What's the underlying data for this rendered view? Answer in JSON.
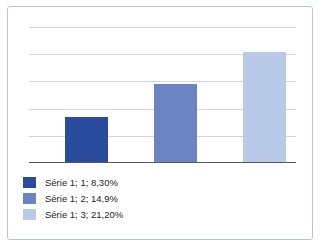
{
  "chart_data": {
    "type": "bar",
    "title": "",
    "subtitle": "",
    "xlabel": "",
    "ylabel": "",
    "categories": [
      "1",
      "2",
      "3"
    ],
    "series": [
      {
        "name": "Série 1",
        "values": [
          8.3,
          14.9,
          21.2
        ]
      }
    ],
    "value_labels": [
      "8,30%",
      "14,9%",
      "21,20%"
    ],
    "ylim": [
      0,
      24
    ],
    "gridlines": [
      4,
      8,
      12,
      16,
      20
    ],
    "grid": true,
    "grid_orientation": "horizontal",
    "axis_tick_labels": [],
    "legend_position": "bottom-left",
    "legend": [
      {
        "label": "Série 1; 1; 8,30%",
        "color": "#2a4a9e",
        "series": "Série 1",
        "category": "1",
        "value": 8.3
      },
      {
        "label": "Série 1; 2; 14,9%",
        "color": "#6b84c4",
        "series": "Série 1",
        "category": "2",
        "value": 14.9
      },
      {
        "label": "Série 1; 3; 21,20%",
        "color": "#b8cae8",
        "series": "Série 1",
        "category": "3",
        "value": 21.2
      }
    ],
    "colors": {
      "bar_1": "#2a4a9e",
      "bar_2": "#6b84c4",
      "bar_3": "#b8cae8",
      "gridline": "#d5d5d5",
      "axis": "#595959",
      "border": "#b9c4da",
      "background": "#ffffff",
      "text": "#232323"
    },
    "bar_geometry": [
      {
        "left_pct": 13.5,
        "width_pct": 16.1,
        "height_pct": 31.5
      },
      {
        "left_pct": 46.8,
        "width_pct": 16.1,
        "height_pct": 54.5
      },
      {
        "left_pct": 80.1,
        "width_pct": 16.1,
        "height_pct": 77.0
      }
    ],
    "gridline_top_pcts": [
      5.0,
      24.0,
      43.0,
      62.0,
      81.0
    ]
  }
}
